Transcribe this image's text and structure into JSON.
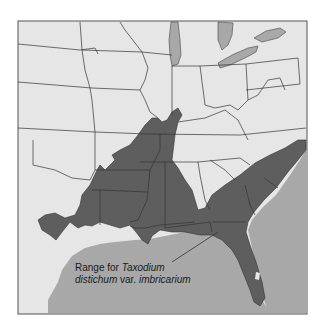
{
  "map": {
    "region": "Southeastern United States",
    "colors": {
      "land": "#e6e6e6",
      "water": "#a8a8a8",
      "range": "#5e5e5e",
      "border": "#333333",
      "frame": "#555555"
    },
    "legend": {
      "prefix": "Range for ",
      "genus": "Taxodium",
      "species": "distichum",
      "rank": " var. ",
      "variety": "imbricarium"
    }
  }
}
